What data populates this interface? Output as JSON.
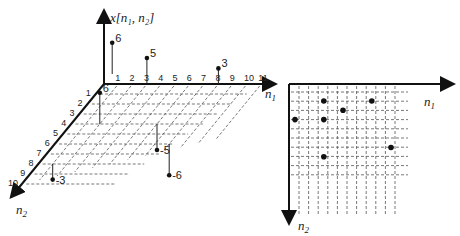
{
  "left_diagram": {
    "vertical_axis_label": "x[n₁, n₂]",
    "n1_axis_label": "n",
    "n1_axis_sub": "1",
    "n2_axis_label": "n",
    "n2_axis_sub": "2",
    "n1_ticks": [
      "1",
      "2",
      "3",
      "4",
      "5",
      "6",
      "7",
      "8",
      "9",
      "10",
      "11"
    ],
    "n2_ticks": [
      "1",
      "2",
      "3",
      "4",
      "5",
      "6",
      "7",
      "8",
      "9",
      "10"
    ],
    "samples": [
      {
        "n1": 0,
        "n2": -1,
        "value": 6,
        "label": "6"
      },
      {
        "n1": 3,
        "n2": 0,
        "value": 5,
        "label": "5"
      },
      {
        "n1": 8,
        "n2": 0,
        "value": 3,
        "label": "3"
      },
      {
        "n1": 2,
        "n2": 4,
        "value": 6,
        "label": "6"
      },
      {
        "n1": 6,
        "n2": 4,
        "value": -5,
        "label": "-5"
      },
      {
        "n1": 1,
        "n2": 8,
        "value": -3,
        "label": "-3"
      },
      {
        "n1": 8,
        "n2": 6,
        "value": -6,
        "label": "-6"
      }
    ]
  },
  "right_diagram": {
    "n1_axis_label": "n",
    "n1_axis_sub": "1",
    "n2_axis_label": "n",
    "n2_axis_sub": "2",
    "points": [
      {
        "n1": 3,
        "n2": 1
      },
      {
        "n1": 8,
        "n2": 1
      },
      {
        "n1": 5,
        "n2": 2
      },
      {
        "n1": 0,
        "n2": 3
      },
      {
        "n1": 3,
        "n2": 3
      },
      {
        "n1": 10,
        "n2": 6
      },
      {
        "n1": 3,
        "n2": 7
      }
    ]
  }
}
